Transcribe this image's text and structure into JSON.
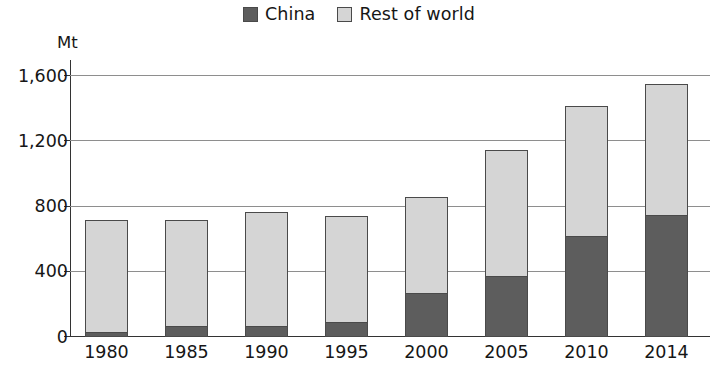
{
  "legend": {
    "position": "top-center",
    "entries": [
      {
        "label": "China",
        "color": "#5d5d5d",
        "swatch_icon": "legend-swatch-icon"
      },
      {
        "label": "Rest of world",
        "color": "#d5d5d5",
        "swatch_icon": "legend-swatch-icon"
      }
    ]
  },
  "axis": {
    "unit_label": "Mt",
    "y_ticks": [
      "0",
      "400",
      "800",
      "1,200",
      "1,600"
    ],
    "y_tick_values": [
      0,
      400,
      800,
      1200,
      1600
    ]
  },
  "chart_data": {
    "type": "bar",
    "stacked": true,
    "title": "",
    "subtitle": "",
    "xlabel": "",
    "ylabel": "Mt",
    "ylim": [
      0,
      1700
    ],
    "yticks": [
      0,
      400,
      800,
      1200,
      1600
    ],
    "ytick_labels": [
      "0",
      "400",
      "800",
      "1,200",
      "1,600"
    ],
    "grid": true,
    "grid_axis": "y",
    "legend_position": "top-center",
    "categories": [
      "1980",
      "1985",
      "1990",
      "1995",
      "2000",
      "2005",
      "2010",
      "2014"
    ],
    "series": [
      {
        "name": "China",
        "color": "#5d5d5d",
        "values": [
          30,
          70,
          65,
          90,
          270,
          375,
          620,
          750
        ]
      },
      {
        "name": "Rest of world",
        "color": "#d5d5d5",
        "values": [
          690,
          650,
          705,
          650,
          590,
          775,
          800,
          800
        ]
      }
    ],
    "totals": [
      720,
      720,
      770,
      740,
      860,
      1150,
      1420,
      1550
    ]
  }
}
